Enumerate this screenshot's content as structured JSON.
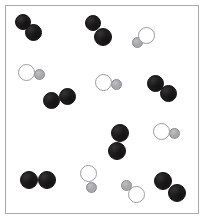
{
  "figure": {
    "background_color": "#ffffff"
  },
  "vessel": {
    "name": "reaction-vessel",
    "x": 5,
    "y": 5,
    "width": 194,
    "height": 209,
    "border_color": "#a9a9ad",
    "border_width": 1,
    "fill_color": "#ffffff"
  },
  "legend_colors": {
    "dark_atom": "#1e1c1d",
    "open_atom_fill": "#ffffff",
    "open_atom_stroke": "#9b9b9f",
    "gray_atom": "#a8a8ac"
  },
  "species": [
    {
      "id": "dark-diatomic",
      "label": "dark diatomic molecule",
      "atom_count": 2,
      "atom_types": [
        "dark",
        "dark"
      ],
      "count_in_figure": 7
    },
    {
      "id": "mixed-diatomic",
      "label": "open-plus-gray diatomic molecule",
      "atom_count": 2,
      "atom_types": [
        "open",
        "gray"
      ],
      "count_in_figure": 6
    }
  ],
  "counts": {
    "dark_molecules": 7,
    "mixed_molecules": 6,
    "total_molecules": 13,
    "total_atoms": 26
  },
  "molecules": [
    {
      "id": "dark-1",
      "species": "dark-diatomic",
      "orientation": "diagonal-down-right",
      "atoms": [
        {
          "type": "dark",
          "cx": 22.5,
          "cy": 22.0,
          "r": 8.0
        },
        {
          "type": "dark",
          "cx": 33.5,
          "cy": 32.5,
          "r": 8.5
        }
      ]
    },
    {
      "id": "dark-2",
      "species": "dark-diatomic",
      "orientation": "diagonal-down-right",
      "atoms": [
        {
          "type": "dark",
          "cx": 93.0,
          "cy": 23.0,
          "r": 8.0
        },
        {
          "type": "dark",
          "cx": 103.0,
          "cy": 37.0,
          "r": 9.0
        }
      ]
    },
    {
      "id": "mixed-1",
      "species": "mixed-diatomic",
      "orientation": "gray-lower-left",
      "atoms": [
        {
          "type": "open",
          "cx": 146.5,
          "cy": 35.5,
          "r": 8.5
        },
        {
          "type": "gray",
          "cx": 137.0,
          "cy": 42.5,
          "r": 5.5
        }
      ]
    },
    {
      "id": "mixed-2",
      "species": "mixed-diatomic",
      "orientation": "gray-right",
      "atoms": [
        {
          "type": "open",
          "cx": 26.0,
          "cy": 72.5,
          "r": 8.5
        },
        {
          "type": "gray",
          "cx": 39.0,
          "cy": 74.5,
          "r": 5.5
        }
      ]
    },
    {
      "id": "mixed-3",
      "species": "mixed-diatomic",
      "orientation": "gray-right",
      "atoms": [
        {
          "type": "open",
          "cx": 103.0,
          "cy": 82.5,
          "r": 8.5
        },
        {
          "type": "gray",
          "cx": 116.5,
          "cy": 84.5,
          "r": 5.5
        }
      ]
    },
    {
      "id": "dark-3",
      "species": "dark-diatomic",
      "orientation": "diagonal-down-right",
      "atoms": [
        {
          "type": "dark",
          "cx": 155.0,
          "cy": 83.5,
          "r": 8.5
        },
        {
          "type": "dark",
          "cx": 168.0,
          "cy": 93.5,
          "r": 8.5
        }
      ]
    },
    {
      "id": "dark-4",
      "species": "dark-diatomic",
      "orientation": "horizontal",
      "atoms": [
        {
          "type": "dark",
          "cx": 51.5,
          "cy": 100.0,
          "r": 8.5
        },
        {
          "type": "dark",
          "cx": 67.5,
          "cy": 96.0,
          "r": 8.5
        }
      ]
    },
    {
      "id": "dark-5",
      "species": "dark-diatomic",
      "orientation": "vertical",
      "atoms": [
        {
          "type": "dark",
          "cx": 119.5,
          "cy": 133.0,
          "r": 9.0
        },
        {
          "type": "dark",
          "cx": 116.5,
          "cy": 150.5,
          "r": 9.0
        }
      ]
    },
    {
      "id": "mixed-4",
      "species": "mixed-diatomic",
      "orientation": "gray-right",
      "atoms": [
        {
          "type": "open",
          "cx": 161.0,
          "cy": 131.5,
          "r": 8.5
        },
        {
          "type": "gray",
          "cx": 174.0,
          "cy": 133.5,
          "r": 5.5
        }
      ]
    },
    {
      "id": "dark-6",
      "species": "dark-diatomic",
      "orientation": "horizontal",
      "atoms": [
        {
          "type": "dark",
          "cx": 29.0,
          "cy": 180.0,
          "r": 9.0
        },
        {
          "type": "dark",
          "cx": 47.0,
          "cy": 180.0,
          "r": 9.0
        }
      ]
    },
    {
      "id": "mixed-5",
      "species": "mixed-diatomic",
      "orientation": "gray-below",
      "atoms": [
        {
          "type": "open",
          "cx": 88.0,
          "cy": 173.5,
          "r": 8.5
        },
        {
          "type": "gray",
          "cx": 91.5,
          "cy": 187.0,
          "r": 5.5
        }
      ]
    },
    {
      "id": "mixed-6",
      "species": "mixed-diatomic",
      "orientation": "gray-upper-left",
      "atoms": [
        {
          "type": "gray",
          "cx": 126.5,
          "cy": 185.5,
          "r": 5.5
        },
        {
          "type": "open",
          "cx": 136.5,
          "cy": 194.5,
          "r": 8.5
        }
      ]
    },
    {
      "id": "dark-7",
      "species": "dark-diatomic",
      "orientation": "diagonal-down-right",
      "atoms": [
        {
          "type": "dark",
          "cx": 163.0,
          "cy": 181.0,
          "r": 9.0
        },
        {
          "type": "dark",
          "cx": 176.5,
          "cy": 192.5,
          "r": 9.0
        }
      ]
    }
  ]
}
